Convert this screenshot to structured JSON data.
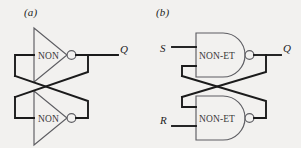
{
  "figure": {
    "background_color": "#f2f1ef",
    "wire_color": "#1b1b1b",
    "gate_outline_color": "#5d5d62",
    "text_color": "#232323",
    "panels": [
      {
        "caption": "(a)",
        "name": "cross-coupled-inverter-latch",
        "gates": [
          {
            "label": "NON",
            "shape": "inverter-triangle",
            "position": "top"
          },
          {
            "label": "NON",
            "shape": "inverter-triangle",
            "position": "bottom"
          }
        ],
        "ports": [
          {
            "label": "Q",
            "kind": "output"
          }
        ]
      },
      {
        "caption": "(b)",
        "name": "nand-sr-latch",
        "gates": [
          {
            "label": "NON-ET",
            "shape": "nand-d-shape",
            "position": "top"
          },
          {
            "label": "NON-ET",
            "shape": "nand-d-shape",
            "position": "bottom"
          }
        ],
        "ports": [
          {
            "label": "S",
            "kind": "input"
          },
          {
            "label": "R",
            "kind": "input"
          },
          {
            "label": "Q",
            "kind": "output"
          }
        ]
      }
    ]
  }
}
